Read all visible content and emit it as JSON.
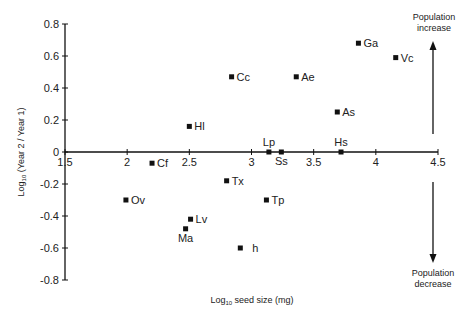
{
  "chart_data": {
    "type": "scatter",
    "title": "",
    "xlabel": "Log10 seed size (mg)",
    "ylabel": "Log10 (Year 2 / Year 1)",
    "xlim": [
      1.5,
      4.5
    ],
    "ylim": [
      -0.8,
      0.8
    ],
    "x_ticks": [
      "1.5",
      "2",
      "2.5",
      "3",
      "3.5",
      "4",
      "4.5"
    ],
    "y_ticks": [
      "0.8",
      "0.6",
      "0.4",
      "0.2",
      "0",
      "-0.2",
      "-0.4",
      "-0.6",
      "-0.8"
    ],
    "grid": false,
    "legend": null,
    "points": [
      {
        "label": "Ga",
        "x": 3.86,
        "y": 0.68
      },
      {
        "label": "Vc",
        "x": 4.16,
        "y": 0.59
      },
      {
        "label": "Cc",
        "x": 2.84,
        "y": 0.47
      },
      {
        "label": "Ae",
        "x": 3.36,
        "y": 0.47
      },
      {
        "label": "As",
        "x": 3.69,
        "y": 0.25
      },
      {
        "label": "Hl",
        "x": 2.5,
        "y": 0.16
      },
      {
        "label": "Lp",
        "x": 3.14,
        "y": 0.0
      },
      {
        "label": "Ss",
        "x": 3.24,
        "y": 0.0
      },
      {
        "label": "Hs",
        "x": 3.72,
        "y": 0.0
      },
      {
        "label": "Cf",
        "x": 2.2,
        "y": -0.07
      },
      {
        "label": "Tx",
        "x": 2.8,
        "y": -0.18
      },
      {
        "label": "Ov",
        "x": 1.99,
        "y": -0.3
      },
      {
        "label": "Tp",
        "x": 3.12,
        "y": -0.3
      },
      {
        "label": "Lv",
        "x": 2.51,
        "y": -0.42
      },
      {
        "label": "Ma",
        "x": 2.47,
        "y": -0.48
      },
      {
        "label": "h",
        "x": 2.91,
        "y": -0.6
      }
    ],
    "annotations": [
      {
        "text": "Population increase",
        "direction": "up"
      },
      {
        "text": "Population decrease",
        "direction": "down"
      }
    ]
  },
  "labels": {
    "xlabel_main": "Log",
    "xlabel_sub": "10",
    "xlabel_rest": " seed size (mg)",
    "ylabel_main": "Log",
    "ylabel_sub": "10",
    "ylabel_rest": " (Year 2 / Year 1)",
    "increase_line1": "Population",
    "increase_line2": "increase",
    "decrease_line1": "Population",
    "decrease_line2": "decrease"
  }
}
